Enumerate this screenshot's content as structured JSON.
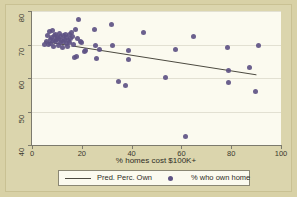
{
  "colors": {
    "figure_background": "#d8d1a6",
    "plot_background": "#fbfaef",
    "marker": "#5e5384",
    "fit_line": "#4c4a40",
    "axis": "#7c7a6d",
    "gridline": "#e2e0d2"
  },
  "legend": {
    "line_entry_label": "Pred. Perc. Own",
    "marker_entry_label": "% who own home"
  },
  "chart_data": {
    "type": "scatter",
    "title": "",
    "xlabel": "% homes cost $100K+",
    "ylabel": "",
    "xlim": [
      0,
      100
    ],
    "ylim": [
      40,
      80
    ],
    "xticks": [
      0,
      20,
      40,
      60,
      80,
      100
    ],
    "yticks": [
      40,
      50,
      60,
      70,
      80
    ],
    "xtick_labels": [
      "0",
      "20",
      "40",
      "60",
      "80",
      "100"
    ],
    "ytick_labels": [
      "40",
      "50",
      "60",
      "70",
      "80"
    ],
    "grid": "horizontal",
    "legend_position": "below-axes",
    "series": [
      {
        "name": "% who own home",
        "type": "scatter",
        "marker": "filled-circle",
        "color": "#5e5384",
        "points": [
          [
            5.2,
            70.1
          ],
          [
            6.0,
            71.0
          ],
          [
            6.4,
            72.6
          ],
          [
            6.8,
            69.9
          ],
          [
            7.1,
            73.8
          ],
          [
            7.4,
            71.6
          ],
          [
            7.6,
            70.4
          ],
          [
            7.9,
            72.2
          ],
          [
            8.2,
            74.3
          ],
          [
            8.5,
            71.2
          ],
          [
            8.8,
            69.3
          ],
          [
            9.0,
            72.8
          ],
          [
            9.3,
            70.8
          ],
          [
            9.6,
            73.1
          ],
          [
            9.9,
            71.4
          ],
          [
            10.2,
            72.0
          ],
          [
            10.5,
            69.6
          ],
          [
            10.8,
            71.8
          ],
          [
            11.0,
            73.4
          ],
          [
            11.3,
            70.6
          ],
          [
            11.6,
            72.3
          ],
          [
            11.9,
            71.1
          ],
          [
            12.2,
            69.0
          ],
          [
            12.5,
            72.7
          ],
          [
            12.8,
            70.9
          ],
          [
            13.1,
            71.5
          ],
          [
            13.4,
            73.0
          ],
          [
            13.7,
            70.2
          ],
          [
            14.0,
            72.1
          ],
          [
            14.3,
            69.5
          ],
          [
            14.6,
            71.3
          ],
          [
            14.9,
            72.9
          ],
          [
            15.2,
            70.7
          ],
          [
            15.6,
            71.9
          ],
          [
            16.0,
            73.5
          ],
          [
            16.4,
            72.4
          ],
          [
            16.8,
            70.0
          ],
          [
            17.2,
            66.1
          ],
          [
            17.6,
            74.6
          ],
          [
            18.0,
            66.3
          ],
          [
            18.4,
            71.7
          ],
          [
            18.8,
            77.4
          ],
          [
            19.4,
            70.9
          ],
          [
            20.0,
            70.5
          ],
          [
            21.0,
            67.8
          ],
          [
            21.6,
            68.2
          ],
          [
            25.0,
            74.4
          ],
          [
            25.4,
            69.8
          ],
          [
            25.8,
            65.8
          ],
          [
            27.0,
            68.4
          ],
          [
            31.8,
            75.9
          ],
          [
            32.4,
            69.7
          ],
          [
            34.8,
            59.1
          ],
          [
            37.4,
            57.9
          ],
          [
            38.6,
            68.3
          ],
          [
            38.8,
            65.4
          ],
          [
            44.6,
            73.5
          ],
          [
            53.6,
            60.1
          ],
          [
            57.6,
            68.6
          ],
          [
            61.8,
            42.6
          ],
          [
            65.0,
            72.5
          ],
          [
            78.6,
            69.1
          ],
          [
            78.8,
            62.2
          ],
          [
            79.0,
            58.6
          ],
          [
            87.2,
            63.0
          ],
          [
            89.8,
            55.9
          ],
          [
            90.8,
            69.8
          ]
        ]
      },
      {
        "name": "Pred. Perc. Own",
        "type": "line",
        "color": "#4c4a40",
        "points": [
          [
            5.0,
            70.8
          ],
          [
            90.5,
            60.8
          ]
        ]
      }
    ]
  }
}
